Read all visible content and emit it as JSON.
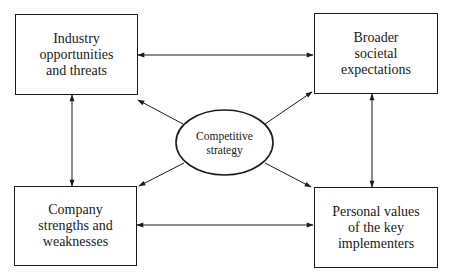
{
  "diagram": {
    "nodes": {
      "top_left": {
        "id": "industry",
        "label": "Industry\nopportunities\nand threats"
      },
      "top_right": {
        "id": "societal",
        "label": "Broader\nsocietal\nexpectations"
      },
      "bottom_left": {
        "id": "company",
        "label": "Company\nstrengths and\nweaknesses"
      },
      "bottom_right": {
        "id": "personal",
        "label": "Personal values\nof the key\nimplementers"
      },
      "center": {
        "id": "strategy",
        "label": "Competitive\nstrategy",
        "shape": "ellipse"
      }
    },
    "edges": [
      {
        "from": "industry",
        "to": "societal",
        "direction": "both"
      },
      {
        "from": "company",
        "to": "personal",
        "direction": "both"
      },
      {
        "from": "industry",
        "to": "company",
        "direction": "both"
      },
      {
        "from": "societal",
        "to": "personal",
        "direction": "both"
      },
      {
        "from": "strategy",
        "to": "industry",
        "direction": "forward"
      },
      {
        "from": "strategy",
        "to": "societal",
        "direction": "forward"
      },
      {
        "from": "strategy",
        "to": "company",
        "direction": "forward"
      },
      {
        "from": "strategy",
        "to": "personal",
        "direction": "forward"
      }
    ],
    "colors": {
      "stroke": "#1a1a1a",
      "background": "#ffffff"
    }
  }
}
